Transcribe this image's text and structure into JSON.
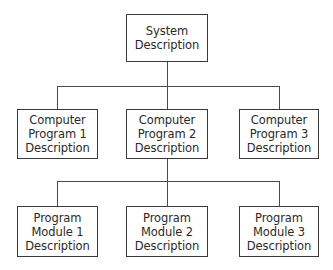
{
  "diagram": {
    "type": "hierarchy",
    "root": {
      "lines": [
        "System",
        "Description"
      ]
    },
    "level2": [
      {
        "lines": [
          "Computer",
          "Program 1",
          "Description"
        ]
      },
      {
        "lines": [
          "Computer",
          "Program 2",
          "Description"
        ]
      },
      {
        "lines": [
          "Computer",
          "Program 3",
          "Description"
        ]
      }
    ],
    "level3": [
      {
        "lines": [
          "Program",
          "Module 1",
          "Description"
        ]
      },
      {
        "lines": [
          "Program",
          "Module 2",
          "Description"
        ]
      },
      {
        "lines": [
          "Program",
          "Module 3",
          "Description"
        ]
      }
    ],
    "edges": [
      [
        "System Description",
        "Computer Program 1 Description"
      ],
      [
        "System Description",
        "Computer Program 2 Description"
      ],
      [
        "System Description",
        "Computer Program 3 Description"
      ],
      [
        "Computer Program 2 Description",
        "Program Module 1 Description"
      ],
      [
        "Computer Program 2 Description",
        "Program Module 2 Description"
      ],
      [
        "Computer Program 2 Description",
        "Program Module 3 Description"
      ]
    ],
    "colors": {
      "line": "#3a3a3a",
      "background": "#ffffff",
      "text": "#2a2a2a"
    }
  }
}
